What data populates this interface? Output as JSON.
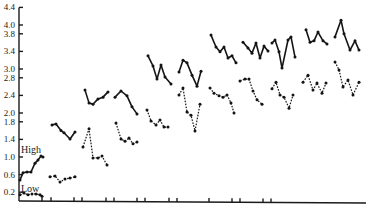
{
  "chart_data": {
    "type": "line",
    "title": "",
    "xlabel": "",
    "ylabel": "",
    "ylim": [
      0,
      4.4
    ],
    "y_ticks": [
      4.4,
      4.0,
      3.8,
      3.4,
      3.0,
      2.8,
      2.4,
      2.0,
      1.8,
      1.4,
      1.0,
      0.6,
      0.2
    ],
    "grid": false,
    "legend": "inline labels at left: High (upper solid), Low (lower dotted)",
    "annotations": [
      "High",
      "Low"
    ],
    "series": [
      {
        "name": "High",
        "style": "solid",
        "segments": [
          [
            0.48,
            0.64,
            0.66,
            0.66,
            0.86,
            0.93,
            1.02,
            1.0
          ],
          [
            1.73,
            1.75,
            1.6,
            1.55,
            1.41,
            1.57
          ],
          [
            2.52,
            2.23,
            2.2,
            2.32,
            2.36,
            2.48
          ],
          [
            2.36,
            2.5,
            2.39,
            2.14,
            1.98
          ],
          [
            3.3,
            3.07,
            2.77,
            3.09,
            2.82,
            2.66
          ],
          [
            2.93,
            3.2,
            3.14,
            2.86,
            2.61,
            2.95
          ],
          [
            3.77,
            3.5,
            3.39,
            3.5,
            3.25,
            3.3,
            3.14
          ],
          [
            3.61,
            3.48,
            3.36,
            3.59,
            3.25,
            3.52,
            3.41
          ],
          [
            3.59,
            3.66,
            3.39,
            3.02,
            3.66,
            3.73,
            3.27
          ],
          [
            3.89,
            3.61,
            3.64,
            3.84,
            3.64,
            3.57
          ],
          [
            3.73,
            4.11,
            3.8,
            3.43,
            3.64,
            3.43
          ]
        ]
      },
      {
        "name": "Low",
        "style": "dotted",
        "segments": [
          [
            0.14,
            0.18,
            0.14,
            0.16,
            0.16,
            0.14,
            0.11
          ],
          [
            0.55,
            0.57,
            0.43,
            0.5,
            0.52,
            0.55
          ],
          [
            1.23,
            1.64,
            0.98,
            0.98,
            1.02,
            0.82
          ],
          [
            1.77,
            1.41,
            1.36,
            1.43,
            1.3,
            1.34
          ],
          [
            2.07,
            1.82,
            1.73,
            1.84,
            1.68,
            1.68
          ],
          [
            2.41,
            2.57,
            2.02,
            1.95,
            1.59,
            2.2
          ],
          [
            2.57,
            2.45,
            2.39,
            2.36,
            2.41,
            2.23,
            2.0
          ],
          [
            2.73,
            2.77,
            2.77,
            2.5,
            2.3,
            2.2
          ],
          [
            2.55,
            2.7,
            2.41,
            2.36,
            2.11,
            2.41
          ],
          [
            2.7,
            2.86,
            2.52,
            2.68,
            2.45,
            2.68
          ],
          [
            3.16,
            2.98,
            2.59,
            2.75,
            2.41,
            2.7
          ]
        ]
      }
    ]
  },
  "axis": {
    "y_tick_labels": [
      "4.4",
      "4.0",
      "3.8",
      "3.4",
      "3.0",
      "2.8",
      "2.4",
      "2.0",
      "1.8",
      "1.4",
      "1.0",
      "0.6",
      "0.2"
    ]
  },
  "labels": {
    "high": "High",
    "low": "Low"
  }
}
